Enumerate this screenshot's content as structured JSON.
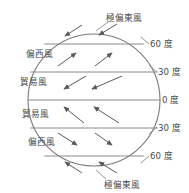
{
  "caption": {
    "text": "　　　　　　　　　　　　　",
    "visible": false
  },
  "diagram": {
    "circle": {
      "cx": 94,
      "cy": 100,
      "r": 66,
      "stroke": "#7a7a7a"
    },
    "latitude_lines": [
      {
        "key": "n60",
        "label": "60 度",
        "y": 44
      },
      {
        "key": "n30",
        "label": "30 度",
        "y": 72
      },
      {
        "key": "eq",
        "label": "0 度",
        "y": 100
      },
      {
        "key": "s30",
        "label": "30 度",
        "y": 128
      },
      {
        "key": "s60",
        "label": "60 度",
        "y": 156
      }
    ],
    "band_labels": [
      {
        "key": "polar-easterlies-north",
        "text": "極偏東風",
        "x": 106,
        "y": 22,
        "anchor": "start"
      },
      {
        "key": "westerlies-north",
        "text": "偏西風",
        "x": 26,
        "y": 56,
        "anchor": "start"
      },
      {
        "key": "trade-winds-north",
        "text": "貿易風",
        "x": 20,
        "y": 84,
        "anchor": "start"
      },
      {
        "key": "trade-winds-south",
        "text": "貿易風",
        "x": 20,
        "y": 116,
        "anchor": "start"
      },
      {
        "key": "westerlies-south",
        "text": "偏西風",
        "x": 26,
        "y": 144,
        "anchor": "start"
      },
      {
        "key": "polar-easterlies-south",
        "text": "極偏東風",
        "x": 104,
        "y": 182,
        "anchor": "start"
      }
    ],
    "degree_labels": [
      {
        "key": "deg-n60",
        "text": "60 度",
        "x": 148,
        "y": 44
      },
      {
        "key": "deg-n30",
        "text": "30 度",
        "x": 155,
        "y": 72
      },
      {
        "key": "deg-eq",
        "text": "0 度",
        "x": 161,
        "y": 100
      },
      {
        "key": "deg-s30",
        "text": "30 度",
        "x": 155,
        "y": 128
      },
      {
        "key": "deg-s60",
        "text": "60 度",
        "x": 148,
        "y": 156
      }
    ],
    "leader_lines": [
      {
        "key": "leader-n60",
        "x1": 141,
        "y1": 38,
        "x2": 148,
        "y2": 44
      },
      {
        "key": "leader-n30",
        "x1": 148,
        "y1": 66,
        "x2": 155,
        "y2": 72
      },
      {
        "key": "leader-s30",
        "x1": 148,
        "y1": 133,
        "x2": 155,
        "y2": 127
      },
      {
        "key": "leader-s60",
        "x1": 141,
        "y1": 162,
        "x2": 148,
        "y2": 156
      },
      {
        "key": "leader-polar-north",
        "x1": 96,
        "y1": 30,
        "x2": 107,
        "y2": 22
      },
      {
        "key": "leader-polar-south",
        "x1": 96,
        "y1": 172,
        "x2": 105,
        "y2": 180
      }
    ],
    "arrows": [
      {
        "key": "arrow-polar-n-1",
        "band": "polar-easterlies-north",
        "x1": 82,
        "y1": 25,
        "x2": 63,
        "y2": 37,
        "head": "end"
      },
      {
        "key": "arrow-polar-n-2",
        "band": "polar-easterlies-north",
        "x1": 116,
        "y1": 24,
        "x2": 96,
        "y2": 36,
        "head": "end"
      },
      {
        "key": "arrow-west-n-1",
        "band": "westerlies-north",
        "x1": 58,
        "y1": 66,
        "x2": 78,
        "y2": 52,
        "head": "end"
      },
      {
        "key": "arrow-west-n-2",
        "band": "westerlies-north",
        "x1": 95,
        "y1": 66,
        "x2": 114,
        "y2": 52,
        "head": "end"
      },
      {
        "key": "arrow-trade-n-1",
        "band": "trade-winds-north",
        "x1": 82,
        "y1": 77,
        "x2": 62,
        "y2": 90,
        "head": "end"
      },
      {
        "key": "arrow-trade-n-2",
        "band": "trade-winds-north",
        "x1": 120,
        "y1": 77,
        "x2": 90,
        "y2": 90,
        "head": "end"
      },
      {
        "key": "arrow-trade-s-1",
        "band": "trade-winds-south",
        "x1": 82,
        "y1": 122,
        "x2": 62,
        "y2": 106,
        "head": "end"
      },
      {
        "key": "arrow-trade-s-2",
        "band": "trade-winds-south",
        "x1": 118,
        "y1": 122,
        "x2": 92,
        "y2": 106,
        "head": "end"
      },
      {
        "key": "arrow-west-s-1",
        "band": "westerlies-south",
        "x1": 58,
        "y1": 133,
        "x2": 78,
        "y2": 146,
        "head": "end"
      },
      {
        "key": "arrow-west-s-2",
        "band": "westerlies-south",
        "x1": 95,
        "y1": 133,
        "x2": 113,
        "y2": 146,
        "head": "end"
      },
      {
        "key": "arrow-polar-s-1",
        "band": "polar-easterlies-south",
        "x1": 82,
        "y1": 173,
        "x2": 63,
        "y2": 161,
        "head": "end"
      },
      {
        "key": "arrow-polar-s-2",
        "band": "polar-easterlies-south",
        "x1": 116,
        "y1": 173,
        "x2": 96,
        "y2": 161,
        "head": "end"
      }
    ],
    "colors": {
      "stroke": "#7a7a7a",
      "line": "#8a8a8a",
      "text": "#4a4a4a",
      "arrow": "#5a5a5a",
      "background": "#ffffff"
    }
  }
}
